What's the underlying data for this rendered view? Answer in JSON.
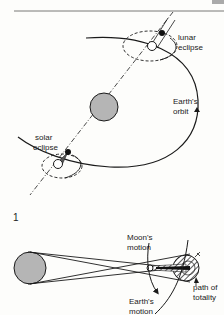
{
  "header": {
    "corner_text": "xxx"
  },
  "figure1": {
    "number": "1",
    "labels": {
      "lunar_eclipse_line1": "lunar",
      "lunar_eclipse_line2": "eclipse",
      "earths_orbit_line1": "Earth's",
      "earths_orbit_line2": "orbit",
      "solar_eclipse_line1": "solar",
      "solar_eclipse_line2": "eclipse"
    }
  },
  "figure2": {
    "labels": {
      "moons_motion_line1": "Moon's",
      "moons_motion_line2": "motion",
      "path_of_totality_line1": "path of",
      "path_of_totality_line2": "totality",
      "earths_motion_line1": "Earth's",
      "earths_motion_line2": "motion"
    }
  },
  "colors": {
    "background": "#fdfdfb",
    "line": "#1a1a1a",
    "sun_fill": "#b5b5b5",
    "hatch": "#333333"
  }
}
